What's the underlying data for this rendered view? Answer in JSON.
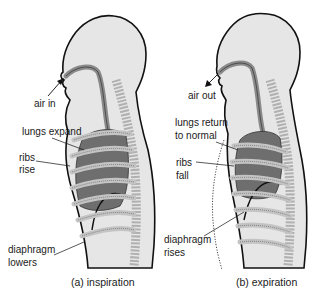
{
  "figure_a": {
    "caption": "(a)  inspiration",
    "labels": {
      "air": "air in",
      "lungs": "lungs expand",
      "ribs_1": "ribs",
      "ribs_2": "rise",
      "diaphragm_1": "diaphragm",
      "diaphragm_2": "lowers"
    }
  },
  "figure_b": {
    "caption": "(b)  expiration",
    "labels": {
      "air": "air out",
      "lungs_1": "lungs return",
      "lungs_2": "to normal",
      "ribs_1": "ribs",
      "ribs_2": "fall",
      "diaphragm_1": "diaphragm",
      "diaphragm_2": "rises"
    }
  },
  "colors": {
    "outline": "#111111",
    "body_fill": "#e6e6e6",
    "airway": "#8a8a8a",
    "lung": "#6e6e6e",
    "rib": "#c4c4c4",
    "spine": "#b0b0b0"
  }
}
